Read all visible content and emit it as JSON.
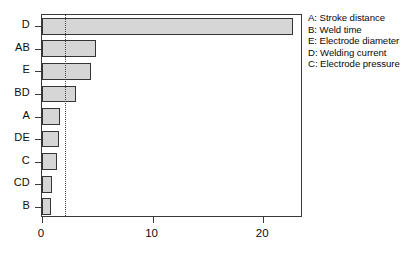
{
  "chart_data": {
    "type": "bar",
    "orientation": "horizontal",
    "title": "",
    "xlabel": "",
    "ylabel": "",
    "categories": [
      "D",
      "AB",
      "E",
      "BD",
      "A",
      "DE",
      "C",
      "CD",
      "B"
    ],
    "values": [
      22.7,
      4.9,
      4.4,
      3.1,
      1.6,
      1.5,
      1.4,
      0.9,
      0.8
    ],
    "xlim": [
      0,
      23.6
    ],
    "xticks": [
      0,
      10,
      20
    ],
    "xticklabels": [
      "0",
      "10",
      "20"
    ],
    "grid": false,
    "reference_line": {
      "value": 2.1,
      "style": "dotted",
      "orientation": "vertical"
    },
    "bar_fill_color": "#d6d6d6",
    "bar_edge_color": "#353535",
    "legend_position": "right-outside",
    "legend": [
      "A: Stroke distance",
      "B: Weld time",
      "E: Electrode diameter",
      "D: Welding current",
      "C: Electrode pressure"
    ]
  },
  "legend": {
    "entries": [
      {
        "text": "A: Stroke distance"
      },
      {
        "text": "B: Weld time"
      },
      {
        "text": "E: Electrode diameter"
      },
      {
        "text": "D: Welding current"
      },
      {
        "text": "C: Electrode pressure"
      }
    ]
  }
}
